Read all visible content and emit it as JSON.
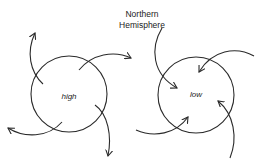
{
  "title": {
    "line1": "Northern",
    "line2": "Hemisphere"
  },
  "systems": [
    {
      "name": "high",
      "label": "high",
      "flow": "outward",
      "rotation": "clockwise",
      "center": [
        69,
        94
      ],
      "radius": 38
    },
    {
      "name": "low",
      "label": "low",
      "flow": "inward",
      "rotation": "counterclockwise",
      "center": [
        196,
        95
      ],
      "radius": 38
    }
  ],
  "colors": {
    "stroke": "#2a2a2a",
    "text": "#222222",
    "background": "#ffffff"
  }
}
